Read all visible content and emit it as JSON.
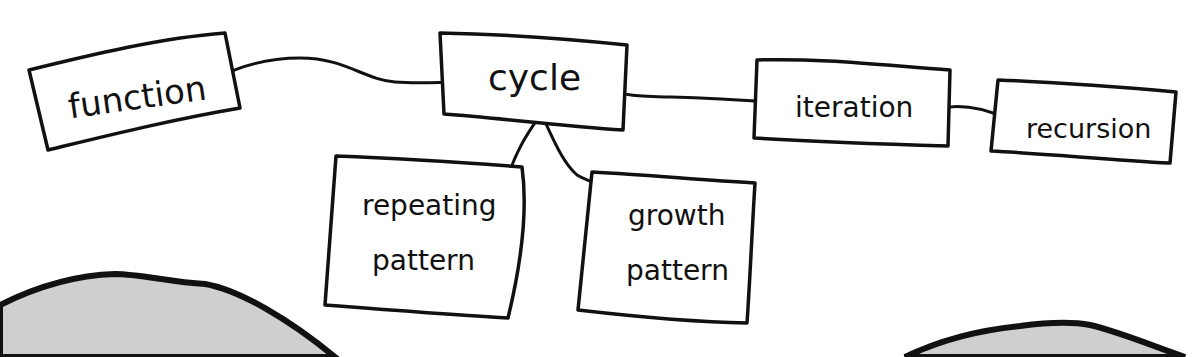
{
  "diagram": {
    "type": "concept-map",
    "style": "hand-drawn",
    "colors": {
      "stroke": "#111111",
      "background": "#ffffff",
      "blob_fill": "#cfcfcf"
    },
    "nodes": [
      {
        "id": "function",
        "label": "function"
      },
      {
        "id": "cycle",
        "label": "cycle"
      },
      {
        "id": "iteration",
        "label": "iteration"
      },
      {
        "id": "recursion",
        "label": "recursion"
      },
      {
        "id": "repeating_pattern",
        "label_line1": "repeating",
        "label_line2": "pattern"
      },
      {
        "id": "growth_pattern",
        "label_line1": "growth",
        "label_line2": "pattern"
      }
    ],
    "edges": [
      {
        "from": "function",
        "to": "cycle"
      },
      {
        "from": "cycle",
        "to": "iteration"
      },
      {
        "from": "iteration",
        "to": "recursion"
      },
      {
        "from": "cycle",
        "to": "repeating_pattern"
      },
      {
        "from": "cycle",
        "to": "growth_pattern"
      }
    ]
  }
}
